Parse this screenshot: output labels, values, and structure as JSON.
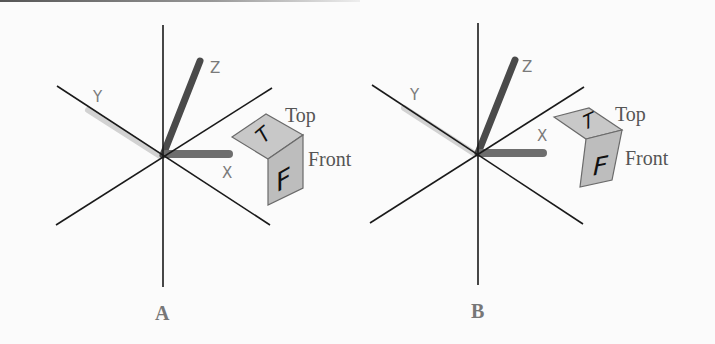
{
  "figures": [
    {
      "id": "A",
      "caption": "A",
      "axis_labels": {
        "x": "X",
        "y": "Y",
        "z": "Z"
      },
      "cube": {
        "top_face_letter": "T",
        "front_face_letter": "F",
        "top_label": "Top",
        "front_label": "Front"
      }
    },
    {
      "id": "B",
      "caption": "B",
      "axis_labels": {
        "x": "X",
        "y": "Y",
        "z": "Z"
      },
      "cube": {
        "top_face_letter": "T",
        "front_face_letter": "F",
        "top_label": "Top",
        "front_label": "Front"
      }
    }
  ],
  "colors": {
    "axis_line": "#1a1a1a",
    "z_rod": "#4a4a4a",
    "x_rod": "#6e6e6e",
    "y_rod": "#cfcfcf",
    "cube_face": "#c6c6c6",
    "cube_edge": "#6a6a6a"
  }
}
